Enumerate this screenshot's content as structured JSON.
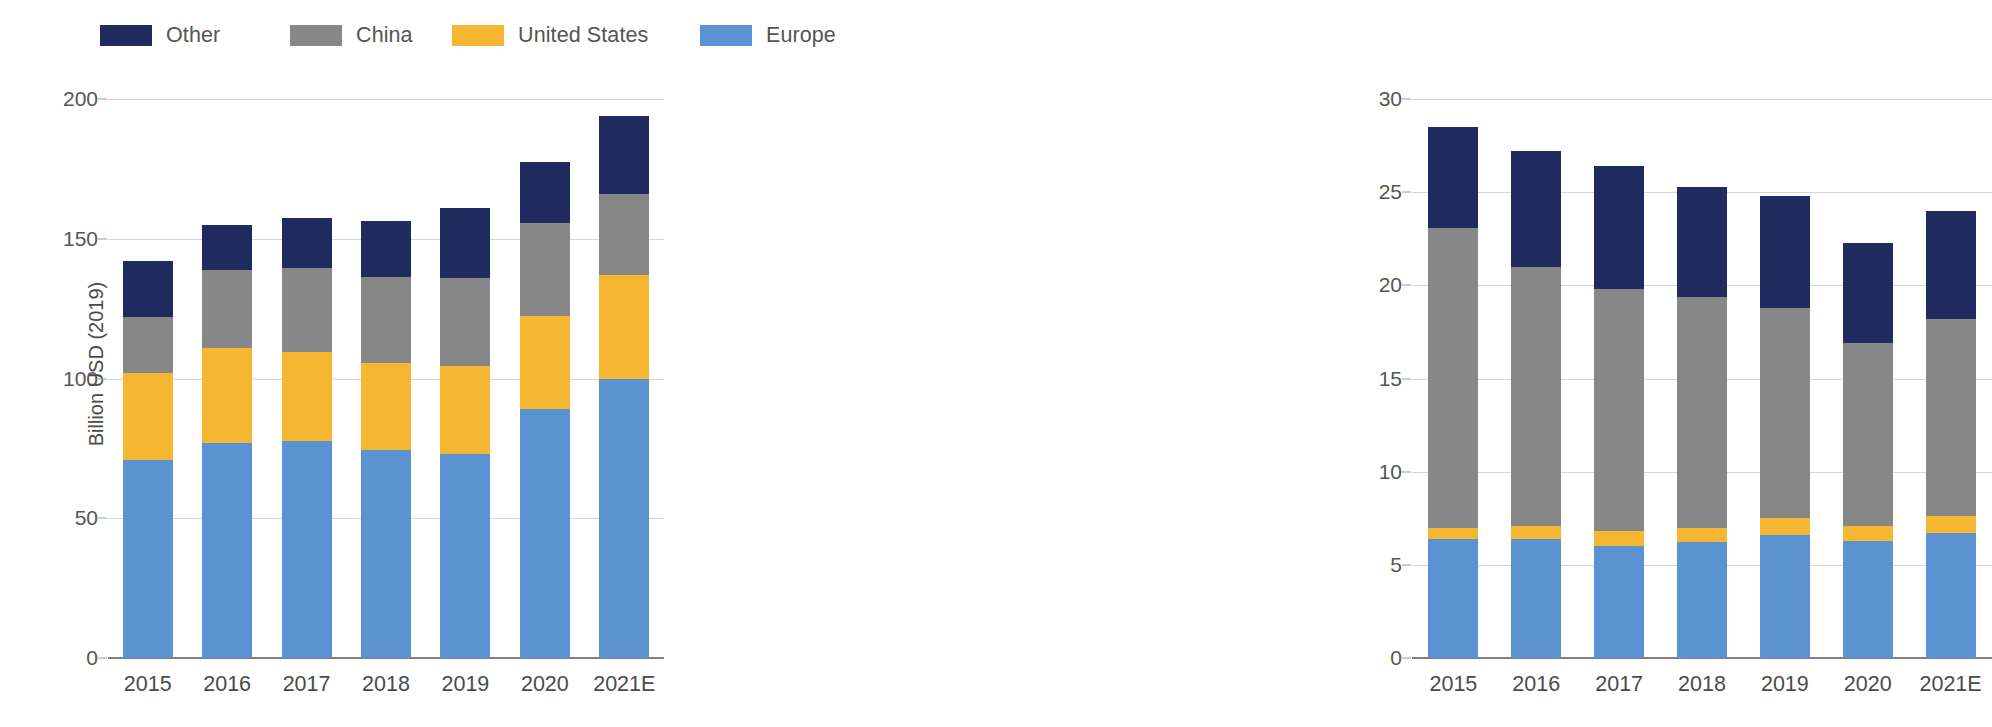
{
  "legend": {
    "items": [
      {
        "label": "Other",
        "color": "#1f2a5e",
        "x": 100
      },
      {
        "label": "China",
        "color": "#878787",
        "x": 290
      },
      {
        "label": "United States",
        "color": "#f5b731",
        "x": 452
      },
      {
        "label": "Europe",
        "color": "#5b92d1",
        "x": 700
      }
    ]
  },
  "colors": {
    "other": "#1f2a5e",
    "china": "#878787",
    "united_states": "#f5b731",
    "europe": "#5b92d1",
    "gridline": "#d6d6d6",
    "axis": "#808080",
    "text": "#4a4a4a"
  },
  "chart_data": [
    {
      "id": "left",
      "type": "bar",
      "stacked": true,
      "title": "",
      "xlabel": "",
      "ylabel": "Billion USD (2019)",
      "ylim": [
        0,
        200
      ],
      "yticks": [
        0,
        50,
        100,
        150,
        200
      ],
      "ytick_labels": [
        "0",
        "50",
        "100",
        "150",
        "200"
      ],
      "grid": true,
      "legend_position": "top",
      "categories": [
        "2015",
        "2016",
        "2017",
        "2018",
        "2019",
        "2020",
        "2021E"
      ],
      "series": [
        {
          "name": "Europe",
          "color": "#5b92d1",
          "values": [
            71,
            77,
            77.5,
            74.5,
            73,
            89,
            100
          ]
        },
        {
          "name": "United States",
          "color": "#f5b731",
          "values": [
            31,
            34,
            32,
            31,
            31.5,
            33.5,
            37
          ]
        },
        {
          "name": "China",
          "color": "#878787",
          "values": [
            20,
            28,
            30,
            31,
            31.5,
            33,
            29
          ]
        },
        {
          "name": "Other",
          "color": "#1f2a5e",
          "values": [
            20,
            16,
            18,
            20,
            25,
            22,
            28
          ]
        }
      ],
      "totals": [
        142,
        155,
        157.5,
        156.5,
        161,
        177.5,
        194
      ]
    },
    {
      "id": "right",
      "type": "bar",
      "stacked": true,
      "title": "",
      "xlabel": "",
      "ylabel": "",
      "ylim": [
        0,
        30
      ],
      "yticks": [
        0,
        5,
        10,
        15,
        20,
        25,
        30
      ],
      "ytick_labels": [
        "0",
        "5",
        "10",
        "15",
        "20",
        "25",
        "30"
      ],
      "grid": true,
      "legend_position": "top",
      "categories": [
        "2015",
        "2016",
        "2017",
        "2018",
        "2019",
        "2020",
        "2021E"
      ],
      "series": [
        {
          "name": "Europe",
          "color": "#5b92d1",
          "values": [
            6.4,
            6.4,
            6.0,
            6.2,
            6.6,
            6.3,
            6.7
          ]
        },
        {
          "name": "United States",
          "color": "#f5b731",
          "values": [
            0.6,
            0.7,
            0.8,
            0.8,
            0.9,
            0.8,
            0.9
          ]
        },
        {
          "name": "China",
          "color": "#878787",
          "values": [
            16.1,
            13.9,
            13.0,
            12.4,
            11.3,
            9.8,
            10.6
          ]
        },
        {
          "name": "Other",
          "color": "#1f2a5e",
          "values": [
            5.4,
            6.2,
            6.6,
            5.9,
            6.0,
            5.4,
            5.8
          ]
        }
      ],
      "totals": [
        28.5,
        27.2,
        26.4,
        25.3,
        24.8,
        22.3,
        24.0
      ]
    }
  ]
}
